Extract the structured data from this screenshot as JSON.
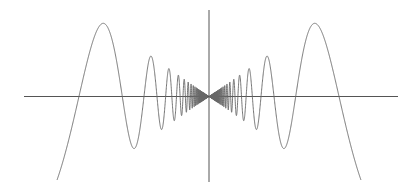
{
  "chart_data": {
    "type": "line",
    "title": "",
    "xlabel": "",
    "ylabel": "",
    "grid": false,
    "legend": null,
    "function": "y = x * sin(1/x)",
    "xlim": [
      -0.186,
      0.186
    ],
    "ylim": [
      -0.15,
      0.15
    ],
    "series": [
      {
        "name": "x sin(1/x)",
        "color": "#666666",
        "samples": 3000
      }
    ],
    "axes": {
      "color": "#555555",
      "origin_px": [
        209,
        96.5
      ],
      "x_axis_px": [
        24,
        398
      ],
      "y_axis_px": [
        10,
        182
      ]
    },
    "scale": {
      "x_px_per_unit": 817,
      "y_px_per_unit": 570
    },
    "key_points": [
      {
        "label": "left major peak",
        "x": -0.1285,
        "y": 0.128
      },
      {
        "label": "right major peak",
        "x": 0.1285,
        "y": 0.128
      },
      {
        "label": "zero crossing n=2",
        "x": 0.159,
        "y": 0
      },
      {
        "label": "zero crossing n=3",
        "x": 0.106,
        "y": 0
      },
      {
        "label": "zero crossing n=4",
        "x": 0.0796,
        "y": 0
      }
    ]
  }
}
